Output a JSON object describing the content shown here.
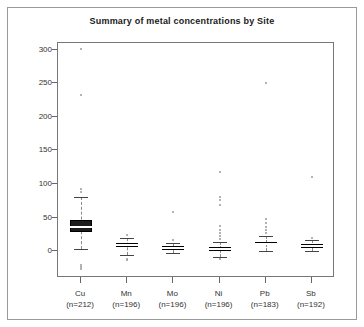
{
  "figure": {
    "title": "Summary of metal concentrations by Site",
    "width": 364,
    "height": 327
  },
  "chart_data": {
    "type": "boxplot",
    "title": "Summary of metal concentrations by Site",
    "xlabel": "",
    "ylabel": "",
    "ylim": [
      -40,
      310
    ],
    "yticks": [
      0,
      50,
      100,
      150,
      200,
      250,
      300
    ],
    "ytick_labels": [
      "0",
      "50",
      "100",
      "150",
      "200",
      "250",
      "300"
    ],
    "grid": false,
    "legend": null,
    "categories": [
      "Cu",
      "Mn",
      "Mo",
      "Ni",
      "Pb",
      "Sb"
    ],
    "category_counts": [
      "(n=212)",
      "(n=196)",
      "(n=196)",
      "(n=196)",
      "(n=183)",
      "(n=192)"
    ],
    "xtick_labels": [
      "Cu\n(n=212)",
      "Mn\n(n=196)",
      "Mo\n(n=196)",
      "Ni\n(n=196)",
      "Pb\n(n=183)",
      "Sb\n(n=192)"
    ],
    "series": [
      {
        "name": "Cu",
        "n": 212,
        "whisker_low": 3,
        "q1": 28,
        "median": 36,
        "q3": 46,
        "whisker_high": 80,
        "outliers": [
          301,
          233,
          93,
          88,
          -20,
          -24,
          -27
        ]
      },
      {
        "name": "Mn",
        "n": 196,
        "whisker_low": -6,
        "q1": 6,
        "median": 9,
        "q3": 12,
        "whisker_high": 20,
        "outliers": [
          24,
          -11,
          -13
        ]
      },
      {
        "name": "Mo",
        "n": 196,
        "whisker_low": -3,
        "q1": 2,
        "median": 4,
        "q3": 7,
        "whisker_high": 12,
        "outliers": [
          58,
          16
        ]
      },
      {
        "name": "Ni",
        "n": 196,
        "whisker_low": -9,
        "q1": 0,
        "median": 3,
        "q3": 6,
        "whisker_high": 14,
        "outliers": [
          118,
          81,
          76,
          69,
          38,
          32,
          27,
          22,
          18,
          -12
        ]
      },
      {
        "name": "Pb",
        "n": 183,
        "whisker_low": 0,
        "q1": 9,
        "median": 11,
        "q3": 14,
        "whisker_high": 22,
        "outliers": [
          250,
          48,
          42,
          36,
          31,
          27
        ]
      },
      {
        "name": "Sb",
        "n": 192,
        "whisker_low": 0,
        "q1": 5,
        "median": 7,
        "q3": 10,
        "whisker_high": 16,
        "outliers": [
          111,
          19
        ]
      }
    ]
  }
}
